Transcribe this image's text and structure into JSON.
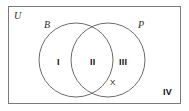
{
  "figure": {
    "type": "venn-diagram",
    "stroke_color": "#6b6b6b",
    "text_color": "#1a1a1a",
    "background_color": "#ffffff"
  },
  "universal_set": {
    "label": "U"
  },
  "sets": [
    {
      "id": "left",
      "label": "B"
    },
    {
      "id": "right",
      "label": "P"
    }
  ],
  "regions": [
    {
      "id": "i",
      "label": "I",
      "meaning": "B only"
    },
    {
      "id": "ii",
      "label": "II",
      "meaning": "B and P"
    },
    {
      "id": "iii",
      "label": "III",
      "meaning": "P only"
    },
    {
      "id": "iv",
      "label": "IV",
      "meaning": "outside both sets"
    }
  ],
  "points": [
    {
      "id": "x",
      "label": "X"
    }
  ],
  "geometry": {
    "rect": {
      "x": 8,
      "y": 6,
      "width": 173,
      "height": 98
    },
    "circle_left": {
      "cx": 76,
      "cy": 60,
      "r": 37
    },
    "circle_right": {
      "cx": 108,
      "cy": 60,
      "r": 37
    }
  }
}
